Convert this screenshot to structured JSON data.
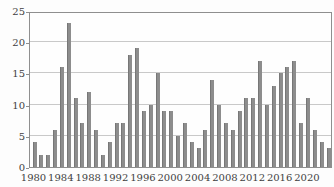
{
  "chart_data": {
    "type": "bar",
    "x": [
      1980,
      1981,
      1982,
      1983,
      1984,
      1985,
      1986,
      1987,
      1988,
      1989,
      1990,
      1991,
      1992,
      1993,
      1994,
      1995,
      1996,
      1997,
      1998,
      1999,
      2000,
      2001,
      2002,
      2003,
      2004,
      2005,
      2006,
      2007,
      2008,
      2009,
      2010,
      2011,
      2012,
      2013,
      2014,
      2015,
      2016,
      2017,
      2018,
      2019,
      2020,
      2021,
      2022,
      2023
    ],
    "values": [
      4,
      2,
      2,
      6,
      16,
      23,
      11,
      7,
      12,
      6,
      2,
      4,
      7,
      7,
      18,
      19,
      9,
      10,
      15,
      9,
      9,
      5,
      7,
      4,
      3,
      6,
      14,
      10,
      7,
      6,
      9,
      11,
      11,
      17,
      10,
      13,
      15,
      16,
      17,
      7,
      11,
      6,
      4,
      3
    ],
    "title": "",
    "xlabel": "",
    "ylabel": "",
    "ylim": [
      0,
      25
    ],
    "yticks": [
      0,
      5,
      10,
      15,
      20,
      25
    ],
    "xtick_labels": [
      "1980",
      "1984",
      "1988",
      "1992",
      "1996",
      "2000",
      "2004",
      "2008",
      "2012",
      "2016",
      "2020"
    ],
    "xtick_years": [
      1980,
      1984,
      1988,
      1992,
      1996,
      2000,
      2004,
      2008,
      2012,
      2016,
      2020
    ],
    "grid": true,
    "legend": null,
    "colors": {
      "bar": "#8d8d8d",
      "bar_edge": "#777777",
      "gridline": "#c9c9c9",
      "frame": "#8f8f8f",
      "text": "#3f3f3f",
      "background": "#fdfdfd"
    }
  },
  "layout_hints": {
    "note": "grayscale scanned-style annual bar chart, no title, no axis titles, no legend"
  }
}
